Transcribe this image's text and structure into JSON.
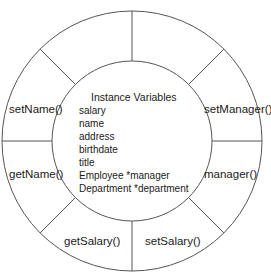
{
  "diagram": {
    "stroke_color": "#555555",
    "center": {
      "x": 132,
      "y": 141
    },
    "outer_radius": 130,
    "inner_radius": 80,
    "core": {
      "title": "Instance Variables",
      "variables": [
        "salary",
        "name",
        "address",
        "birthdate",
        "title",
        "Employee *manager",
        "Department *department"
      ]
    },
    "methods": [
      {
        "label": "setName()",
        "position": "left-upper"
      },
      {
        "label": "getName()",
        "position": "left-lower"
      },
      {
        "label": "getSalary()",
        "position": "bottom-left"
      },
      {
        "label": "setSalary()",
        "position": "bottom-right"
      },
      {
        "label": "manager()",
        "position": "right-lower"
      },
      {
        "label": "setManager()",
        "position": "right-upper"
      }
    ],
    "empty_segments": [
      "top-left",
      "top-right"
    ]
  }
}
